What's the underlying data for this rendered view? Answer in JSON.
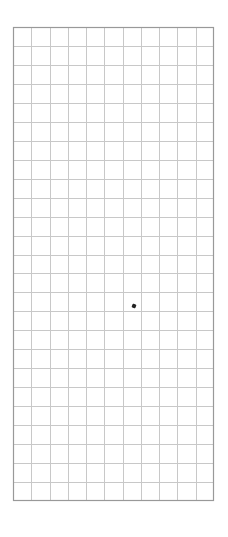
{
  "grid": {
    "columns": 11,
    "rows": 25,
    "line_color": "#c8c8c8",
    "border_color": "#999999",
    "background": "#ffffff"
  },
  "markers": [
    {
      "name": "dot",
      "col_fraction": 0.604,
      "row_fraction": 0.589,
      "color": "#222222"
    }
  ]
}
